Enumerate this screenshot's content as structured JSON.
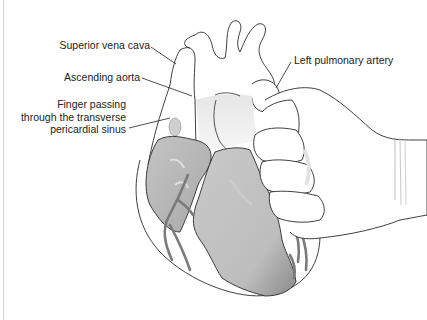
{
  "figure": {
    "labels": {
      "superior_vena_cava": "Superior vena cava",
      "ascending_aorta": "Ascending aorta",
      "finger_line1": "Finger passing",
      "finger_line2": "through the transverse",
      "finger_line3": "pericardial sinus",
      "left_pulmonary_artery": "Left pulmonary artery"
    },
    "colors": {
      "outline": "#2a2a2a",
      "tissue_shade": "#b8b8b8",
      "tissue_dark": "#8f8f8f",
      "vessel": "#7a7a7a",
      "background": "#ffffff"
    }
  }
}
